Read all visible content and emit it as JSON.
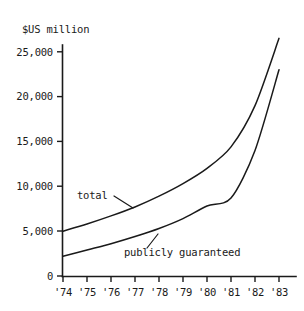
{
  "chart_data": {
    "type": "line",
    "title": "",
    "ylabel": "$US million",
    "xlabel": "",
    "x": [
      "'74",
      "'75",
      "'76",
      "'77",
      "'78",
      "'79",
      "'80",
      "'81",
      "'82",
      "'83"
    ],
    "categories": [
      "'74",
      "'75",
      "'76",
      "'77",
      "'78",
      "'79",
      "'80",
      "'81",
      "'82",
      "'83"
    ],
    "ylim": [
      0,
      26500
    ],
    "yticks": [
      0,
      5000,
      10000,
      15000,
      20000,
      25000
    ],
    "ytick_labels": [
      "0",
      "5,000",
      "10,000",
      "15,000",
      "20,000",
      "25,000"
    ],
    "grid": false,
    "legend_position": "inline-annotations",
    "series": [
      {
        "name": "total",
        "values": [
          5000,
          5800,
          6700,
          7700,
          8900,
          10300,
          12000,
          14400,
          19000,
          26500
        ]
      },
      {
        "name": "publicly guaranteed",
        "values": [
          2200,
          2900,
          3600,
          4400,
          5300,
          6400,
          7800,
          8700,
          14000,
          23000
        ]
      }
    ],
    "annotations": [
      {
        "text": "total",
        "target_series": "total"
      },
      {
        "text": "publicly guaranteed",
        "target_series": "publicly guaranteed"
      }
    ],
    "colors": {
      "line": "#1a1a1a",
      "background": "#ffffff"
    }
  },
  "axis": {
    "unit_title": "$US million",
    "y_labels": [
      "25,000",
      "20,000",
      "15,000",
      "10,000",
      "5,000",
      "0"
    ],
    "x_labels": [
      "'74",
      "'75",
      "'76",
      "'77",
      "'78",
      "'79",
      "'80",
      "'81",
      "'82",
      "'83"
    ]
  },
  "annotations": {
    "total_label": "total",
    "publicly_guaranteed_label": "publicly guaranteed"
  }
}
